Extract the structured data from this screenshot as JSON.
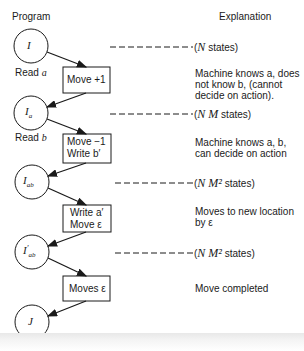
{
  "headers": {
    "program": "Program",
    "explanation": "Explanation"
  },
  "nodes": [
    {
      "id": "I",
      "label": "I",
      "sub": "",
      "prime": false
    },
    {
      "id": "Ia",
      "label": "I",
      "sub": "a",
      "prime": false
    },
    {
      "id": "Iab",
      "label": "I",
      "sub": "ab",
      "prime": false
    },
    {
      "id": "Iab_prime",
      "label": "I",
      "sub": "ab",
      "prime": true
    },
    {
      "id": "J",
      "label": "J",
      "sub": "",
      "prime": false
    }
  ],
  "read_labels": {
    "read_a": "Read",
    "read_a_var": "a",
    "read_b": "Read",
    "read_b_var": "b"
  },
  "boxes": [
    {
      "line1": "Move +1",
      "line2": ""
    },
    {
      "line1": "Move −1",
      "line2": "Write b′"
    },
    {
      "line1": "Write a′",
      "line2": "Move ε"
    },
    {
      "line1": "Moves ε",
      "line2": ""
    }
  ],
  "state_counts": [
    {
      "pre": "(",
      "math": "N",
      "post": " states)"
    },
    {
      "pre": "(",
      "math": "N M",
      "post": " states)"
    },
    {
      "pre": "(",
      "math": "N M²",
      "post": " states)"
    },
    {
      "pre": "(",
      "math": "N M²",
      "post": " states)"
    }
  ],
  "explanations": [
    "Machine knows a, does\nnot know b, (cannot\ndecide on action).",
    "Machine knows a, b,\ncan decide on action",
    "Moves to new location\nby ε",
    "Move completed"
  ],
  "colors": {
    "ink": "#1a1a1a",
    "background": "#ffffff"
  }
}
